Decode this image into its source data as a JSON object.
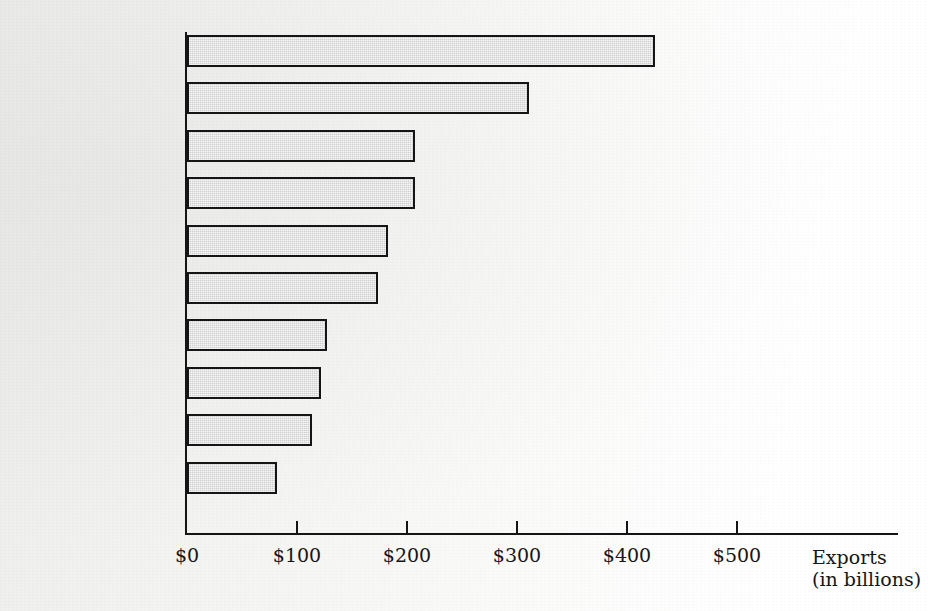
{
  "chart_data": {
    "type": "bar",
    "orientation": "horizontal",
    "title": "",
    "xlabel": "Exports",
    "xlabel_sub": "(in billions)",
    "ylabel": "",
    "categories": [
      "United States",
      "Japan",
      "France",
      "Italy",
      "United Kingdom",
      "Niue",
      "Netherlands",
      "Canada",
      "Belgium",
      "Hong Kong"
    ],
    "values": [
      425,
      311,
      207,
      207,
      183,
      174,
      127,
      122,
      114,
      82
    ],
    "xlim": [
      0,
      545
    ],
    "xticks": [
      0,
      100,
      200,
      300,
      400,
      500
    ],
    "xtick_labels": [
      "$0",
      "$100",
      "$200",
      "$300",
      "$400",
      "$500"
    ],
    "grid": false,
    "legend": false,
    "bar_fill_color": "#cfcfcf",
    "bar_edge_color": "#151515",
    "axis_color": "#151515",
    "background_color": "#f3f3f1"
  },
  "axis": {
    "title_line1": "Exports",
    "title_line2": "(in billions)"
  }
}
